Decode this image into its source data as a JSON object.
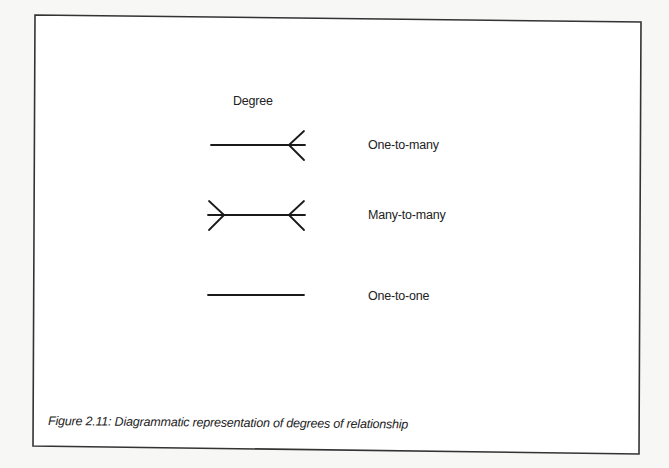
{
  "figure": {
    "heading": "Degree",
    "caption": "Figure 2.11: Diagrammatic representation of degrees of relationship",
    "line_color": "#1a1a1a",
    "frame_color": "#333333",
    "background": "#f7f7f5"
  },
  "relationships": [
    {
      "label": "One-to-many",
      "symbol": "crows-foot-right"
    },
    {
      "label": "Many-to-many",
      "symbol": "crows-foot-both"
    },
    {
      "label": "One-to-one",
      "symbol": "plain-line"
    }
  ]
}
